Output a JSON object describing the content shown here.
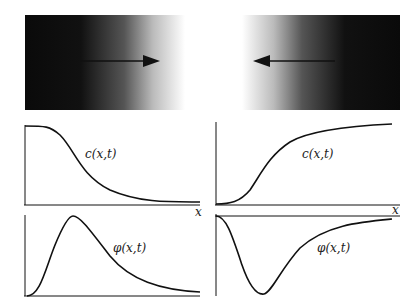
{
  "figure": {
    "top_left_panel": {
      "description": "dark-to-light gradient with rightward arrow"
    },
    "top_right_panel": {
      "description": "light-to-dark gradient with leftward arrow"
    },
    "plots": {
      "top_left": {
        "curve_label": "c(x,t)",
        "axis_label": "x"
      },
      "top_right": {
        "curve_label": "c(x,t)",
        "axis_label": "x"
      },
      "bottom_left": {
        "curve_label": "φ(x,t)"
      },
      "bottom_right": {
        "curve_label": "φ(x,t)"
      }
    }
  }
}
